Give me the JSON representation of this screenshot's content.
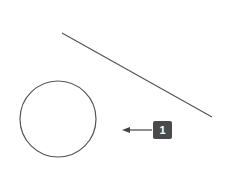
{
  "diagram": {
    "line": {
      "x1": 62,
      "y1": 33,
      "x2": 212,
      "y2": 117,
      "color": "#555555"
    },
    "circle": {
      "cx": 58,
      "cy": 119,
      "r": 38,
      "color": "#555555"
    },
    "arrow": {
      "x1": 152,
      "y1": 130,
      "x2": 123,
      "y2": 130,
      "direction": "left",
      "color": "#444444"
    },
    "callout": {
      "label": "1",
      "color": "#4a4a4a"
    }
  }
}
